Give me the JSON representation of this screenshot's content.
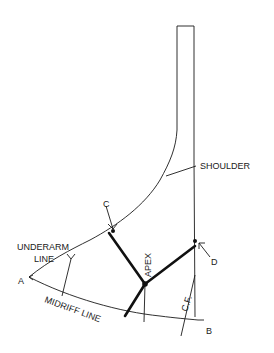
{
  "diagram": {
    "type": "pattern-draft",
    "labels": {
      "shoulder": "SHOULDER",
      "underarm_line_1": "UNDERARM",
      "underarm_line_2": "LINE",
      "midriff": "MIDRIFF LINE",
      "apex": "APEX",
      "center_front": "C.F.",
      "point_a": "A",
      "point_b": "B",
      "point_c": "C",
      "point_d": "D"
    },
    "colors": {
      "line": "#1a1a1a",
      "background": "#ffffff"
    }
  }
}
